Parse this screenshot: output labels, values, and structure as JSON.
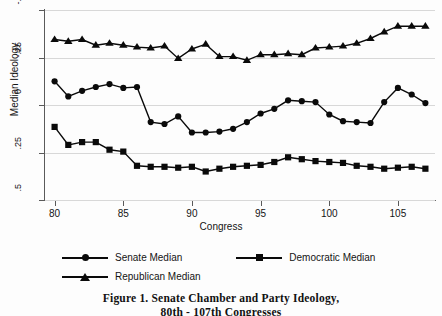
{
  "figure": {
    "caption_line1": "Figure 1.  Senate Chamber and Party Ideology,",
    "caption_line2": "80th - 107th Congresses"
  },
  "legend": {
    "position": "below-axis",
    "entries": [
      {
        "label": "Senate Median",
        "marker": "circle-marker-icon"
      },
      {
        "label": "Democratic Median",
        "marker": "square-marker-icon"
      },
      {
        "label": "Republican Median",
        "marker": "triangle-marker-icon"
      }
    ]
  },
  "axes": {
    "ylabel": "Median Ideology",
    "xlabel": "Congress",
    "yticks": [
      ".5",
      ".25",
      "0",
      "-.25",
      "-.5"
    ],
    "xticks": [
      "80",
      "85",
      "90",
      "95",
      "100",
      "105"
    ]
  },
  "chart_data": {
    "type": "line",
    "title": "Figure 1.  Senate Chamber and Party Ideology, 80th - 107th Congresses",
    "xlabel": "Congress",
    "ylabel": "Median Ideology",
    "xlim": [
      79.3,
      107.7
    ],
    "ylim": [
      -0.5,
      0.5
    ],
    "yticks": [
      -0.5,
      -0.25,
      0,
      0.25,
      0.5
    ],
    "xticks": [
      80,
      85,
      90,
      95,
      100,
      105
    ],
    "grid": true,
    "legend_position": "below",
    "x": [
      80,
      81,
      82,
      83,
      84,
      85,
      86,
      87,
      88,
      89,
      90,
      91,
      92,
      93,
      94,
      95,
      96,
      97,
      98,
      99,
      100,
      101,
      102,
      103,
      104,
      105,
      106,
      107
    ],
    "series": [
      {
        "name": "Senate Median",
        "marker": "circle",
        "values": [
          0.125,
          0.045,
          0.075,
          0.095,
          0.11,
          0.09,
          0.095,
          -0.09,
          -0.1,
          -0.06,
          -0.145,
          -0.145,
          -0.14,
          -0.125,
          -0.09,
          -0.045,
          -0.02,
          0.025,
          0.02,
          0.015,
          -0.05,
          -0.085,
          -0.09,
          -0.095,
          0.015,
          0.09,
          0.055,
          0.01
        ]
      },
      {
        "name": "Democratic Median",
        "marker": "square",
        "values": [
          -0.115,
          -0.21,
          -0.195,
          -0.195,
          -0.235,
          -0.245,
          -0.32,
          -0.325,
          -0.325,
          -0.33,
          -0.325,
          -0.35,
          -0.335,
          -0.325,
          -0.32,
          -0.315,
          -0.3,
          -0.275,
          -0.285,
          -0.295,
          -0.3,
          -0.305,
          -0.32,
          -0.325,
          -0.335,
          -0.33,
          -0.325,
          -0.335
        ]
      },
      {
        "name": "Republican Median",
        "marker": "triangle",
        "values": [
          0.345,
          0.335,
          0.345,
          0.315,
          0.325,
          0.315,
          0.305,
          0.3,
          0.31,
          0.245,
          0.295,
          0.32,
          0.255,
          0.255,
          0.235,
          0.265,
          0.265,
          0.27,
          0.265,
          0.3,
          0.305,
          0.31,
          0.325,
          0.35,
          0.385,
          0.415,
          0.415,
          0.415
        ]
      }
    ]
  }
}
